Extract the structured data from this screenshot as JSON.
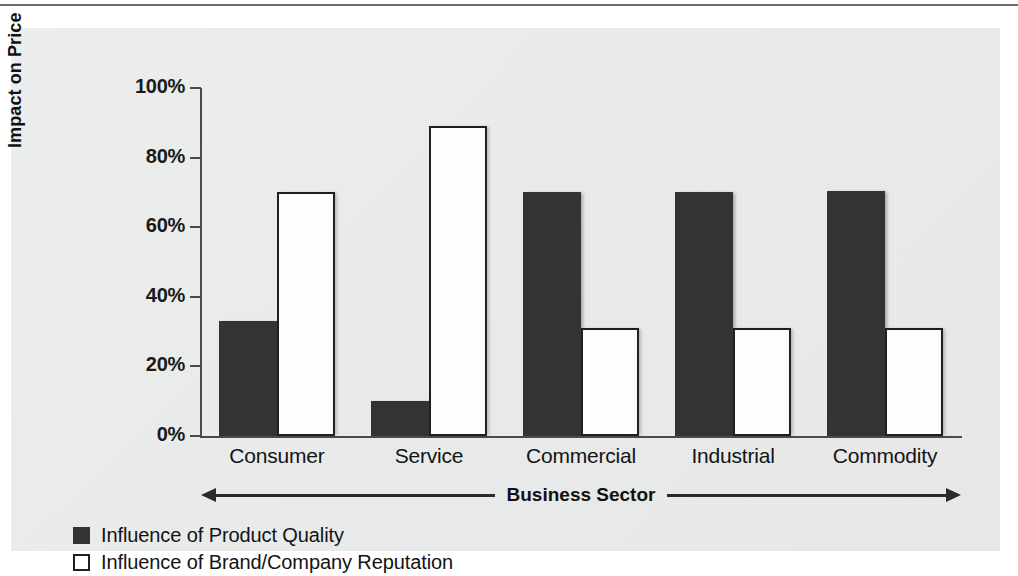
{
  "chart_data": {
    "type": "bar",
    "title": "",
    "xlabel": "Business Sector",
    "ylabel": "Impact on Price",
    "ylim": [
      0,
      100
    ],
    "yticks": [
      "0%",
      "20%",
      "40%",
      "60%",
      "80%",
      "100%"
    ],
    "ytick_values": [
      0,
      20,
      40,
      60,
      80,
      100
    ],
    "grid": false,
    "legend_position": "below-left",
    "categories": [
      "Consumer",
      "Service",
      "Commercial",
      "Industrial",
      "Commodity"
    ],
    "series": [
      {
        "name": "Influence of Product Quality",
        "color": "#333333",
        "values": [
          33,
          10,
          70,
          70,
          70.5
        ]
      },
      {
        "name": "Influence of Brand/Company Reputation",
        "color": "#ffffff",
        "values": [
          70,
          89,
          31,
          31,
          31
        ]
      }
    ]
  },
  "axes": {
    "y_title": "Impact on Price",
    "x_title": "Business Sector",
    "y_labels": [
      "100%",
      "80%",
      "60%",
      "40%",
      "20%",
      "0%"
    ]
  },
  "legend": {
    "items": [
      {
        "label": "Influence of Product Quality",
        "swatch": "dark"
      },
      {
        "label": "Influence of Brand/Company Reputation",
        "swatch": "light"
      }
    ]
  },
  "colors": {
    "bar_dark": "#333333",
    "bar_light": "#ffffff",
    "panel_background": "#eaebeb",
    "axis": "#4a4a4a",
    "text": "#141414"
  }
}
